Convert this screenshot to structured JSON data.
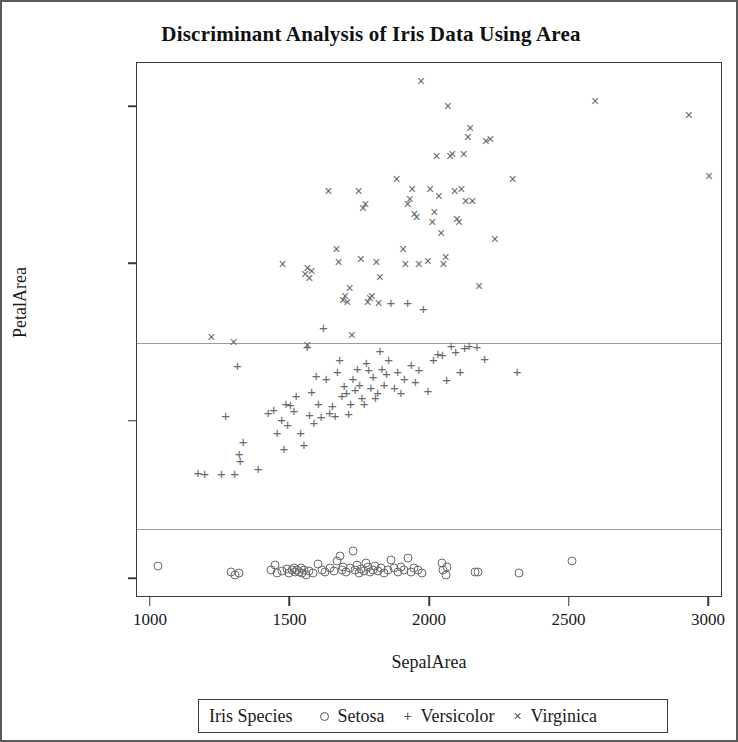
{
  "chart_data": {
    "type": "scatter",
    "title": "Discriminant Analysis of Iris Data Using Area",
    "xlabel": "SepalArea",
    "ylabel": "PetalArea",
    "xlim": [
      950,
      3050
    ],
    "ylim": [
      -60,
      1640
    ],
    "xticks": [
      1000,
      1500,
      2000,
      2500,
      3000
    ],
    "yticks": [
      0,
      500,
      1000,
      1500
    ],
    "grid": false,
    "legend_position": "bottom",
    "legend_title": "Iris Species",
    "reference_lines": [
      {
        "axis": "y",
        "value": 160,
        "color": "#9a9a9a"
      },
      {
        "axis": "y",
        "value": 750,
        "color": "#9a9a9a"
      }
    ],
    "series": [
      {
        "name": "Setosa",
        "marker": "circle",
        "color": "#6a6a6a",
        "points": [
          [
            1026,
            42
          ],
          [
            1288,
            22
          ],
          [
            1316,
            18
          ],
          [
            1300,
            12
          ],
          [
            1430,
            30
          ],
          [
            1444,
            44
          ],
          [
            1452,
            20
          ],
          [
            1470,
            25
          ],
          [
            1488,
            33
          ],
          [
            1496,
            18
          ],
          [
            1505,
            28
          ],
          [
            1512,
            36
          ],
          [
            1518,
            22
          ],
          [
            1524,
            30
          ],
          [
            1530,
            24
          ],
          [
            1536,
            34
          ],
          [
            1542,
            20
          ],
          [
            1548,
            28
          ],
          [
            1556,
            14
          ],
          [
            1566,
            26
          ],
          [
            1580,
            18
          ],
          [
            1600,
            48
          ],
          [
            1612,
            30
          ],
          [
            1624,
            22
          ],
          [
            1640,
            34
          ],
          [
            1655,
            26
          ],
          [
            1668,
            58
          ],
          [
            1676,
            72
          ],
          [
            1684,
            30
          ],
          [
            1690,
            40
          ],
          [
            1700,
            24
          ],
          [
            1712,
            36
          ],
          [
            1724,
            88
          ],
          [
            1730,
            28
          ],
          [
            1738,
            44
          ],
          [
            1746,
            20
          ],
          [
            1754,
            32
          ],
          [
            1762,
            26
          ],
          [
            1770,
            50
          ],
          [
            1778,
            38
          ],
          [
            1786,
            24
          ],
          [
            1794,
            30
          ],
          [
            1802,
            42
          ],
          [
            1812,
            26
          ],
          [
            1824,
            34
          ],
          [
            1836,
            20
          ],
          [
            1848,
            28
          ],
          [
            1860,
            60
          ],
          [
            1872,
            36
          ],
          [
            1884,
            24
          ],
          [
            1896,
            40
          ],
          [
            1908,
            30
          ],
          [
            1920,
            66
          ],
          [
            1932,
            24
          ],
          [
            1944,
            34
          ],
          [
            1958,
            28
          ],
          [
            1972,
            20
          ],
          [
            2044,
            52
          ],
          [
            2048,
            30
          ],
          [
            2056,
            12
          ],
          [
            2062,
            40
          ],
          [
            2160,
            24
          ],
          [
            2172,
            22
          ],
          [
            2320,
            18
          ],
          [
            2508,
            58
          ]
        ]
      },
      {
        "name": "Versicolor",
        "marker": "plus",
        "color": "#6a6a6a",
        "points": [
          [
            1168,
            340
          ],
          [
            1192,
            336
          ],
          [
            1252,
            336
          ],
          [
            1268,
            520
          ],
          [
            1300,
            336
          ],
          [
            1310,
            680
          ],
          [
            1316,
            400
          ],
          [
            1320,
            380
          ],
          [
            1330,
            438
          ],
          [
            1384,
            352
          ],
          [
            1420,
            530
          ],
          [
            1440,
            540
          ],
          [
            1452,
            468
          ],
          [
            1468,
            510
          ],
          [
            1476,
            418
          ],
          [
            1484,
            560
          ],
          [
            1490,
            492
          ],
          [
            1500,
            556
          ],
          [
            1512,
            536
          ],
          [
            1520,
            584
          ],
          [
            1536,
            468
          ],
          [
            1548,
            430
          ],
          [
            1560,
            740
          ],
          [
            1568,
            524
          ],
          [
            1576,
            598
          ],
          [
            1584,
            500
          ],
          [
            1592,
            648
          ],
          [
            1600,
            560
          ],
          [
            1610,
            518
          ],
          [
            1618,
            800
          ],
          [
            1628,
            640
          ],
          [
            1640,
            532
          ],
          [
            1650,
            552
          ],
          [
            1660,
            520
          ],
          [
            1668,
            660
          ],
          [
            1676,
            700
          ],
          [
            1684,
            586
          ],
          [
            1692,
            616
          ],
          [
            1700,
            596
          ],
          [
            1708,
            528
          ],
          [
            1716,
            560
          ],
          [
            1724,
            640
          ],
          [
            1732,
            604
          ],
          [
            1740,
            672
          ],
          [
            1748,
            620
          ],
          [
            1756,
            580
          ],
          [
            1764,
            560
          ],
          [
            1772,
            690
          ],
          [
            1780,
            668
          ],
          [
            1788,
            612
          ],
          [
            1796,
            644
          ],
          [
            1804,
            580
          ],
          [
            1812,
            596
          ],
          [
            1820,
            728
          ],
          [
            1828,
            672
          ],
          [
            1836,
            620
          ],
          [
            1844,
            656
          ],
          [
            1852,
            700
          ],
          [
            1860,
            880
          ],
          [
            1872,
            612
          ],
          [
            1884,
            660
          ],
          [
            1896,
            596
          ],
          [
            1908,
            640
          ],
          [
            1920,
            880
          ],
          [
            1932,
            684
          ],
          [
            1948,
            628
          ],
          [
            1960,
            668
          ],
          [
            1976,
            860
          ],
          [
            1992,
            600
          ],
          [
            2012,
            700
          ],
          [
            2028,
            720
          ],
          [
            2044,
            716
          ],
          [
            2060,
            636
          ],
          [
            2076,
            744
          ],
          [
            2092,
            724
          ],
          [
            2108,
            660
          ],
          [
            2124,
            736
          ],
          [
            2140,
            744
          ],
          [
            2168,
            740
          ],
          [
            2196,
            704
          ],
          [
            2312,
            660
          ]
        ]
      },
      {
        "name": "Virginica",
        "marker": "cross",
        "color": "#6a6a6a",
        "points": [
          [
            1216,
            768
          ],
          [
            1296,
            752
          ],
          [
            1472,
            1000
          ],
          [
            1552,
            968
          ],
          [
            1560,
            988
          ],
          [
            1568,
            956
          ],
          [
            1576,
            980
          ],
          [
            1560,
            744
          ],
          [
            1636,
            1232
          ],
          [
            1664,
            1048
          ],
          [
            1672,
            1008
          ],
          [
            1688,
            888
          ],
          [
            1696,
            900
          ],
          [
            1704,
            880
          ],
          [
            1712,
            924
          ],
          [
            1720,
            776
          ],
          [
            1744,
            1232
          ],
          [
            1752,
            1016
          ],
          [
            1760,
            1180
          ],
          [
            1768,
            1192
          ],
          [
            1776,
            880
          ],
          [
            1784,
            892
          ],
          [
            1792,
            900
          ],
          [
            1808,
            1008
          ],
          [
            1816,
            876
          ],
          [
            1820,
            960
          ],
          [
            1880,
            1272
          ],
          [
            1904,
            1048
          ],
          [
            1912,
            1000
          ],
          [
            1920,
            1192
          ],
          [
            1928,
            1208
          ],
          [
            1936,
            1240
          ],
          [
            1944,
            1160
          ],
          [
            1952,
            1152
          ],
          [
            1960,
            1000
          ],
          [
            1968,
            1584
          ],
          [
            1992,
            1012
          ],
          [
            2000,
            1240
          ],
          [
            2008,
            1136
          ],
          [
            2016,
            1168
          ],
          [
            2024,
            1344
          ],
          [
            2032,
            1216
          ],
          [
            2040,
            1100
          ],
          [
            2048,
            1000
          ],
          [
            2056,
            1024
          ],
          [
            2064,
            1504
          ],
          [
            2072,
            1344
          ],
          [
            2080,
            1352
          ],
          [
            2088,
            1232
          ],
          [
            2096,
            1144
          ],
          [
            2104,
            1136
          ],
          [
            2112,
            1240
          ],
          [
            2120,
            1352
          ],
          [
            2128,
            1200
          ],
          [
            2136,
            1404
          ],
          [
            2144,
            1432
          ],
          [
            2152,
            1200
          ],
          [
            2176,
            932
          ],
          [
            2200,
            1392
          ],
          [
            2216,
            1400
          ],
          [
            2232,
            1080
          ],
          [
            2296,
            1272
          ],
          [
            2592,
            1520
          ],
          [
            2928,
            1476
          ],
          [
            3000,
            1280
          ]
        ]
      }
    ]
  },
  "legend": {
    "title": "Iris Species",
    "entries": [
      {
        "symbol": "circle-marker-icon",
        "label": "Setosa"
      },
      {
        "symbol": "plus-marker-icon",
        "label": "Versicolor"
      },
      {
        "symbol": "cross-marker-icon",
        "label": "Virginica"
      }
    ]
  }
}
